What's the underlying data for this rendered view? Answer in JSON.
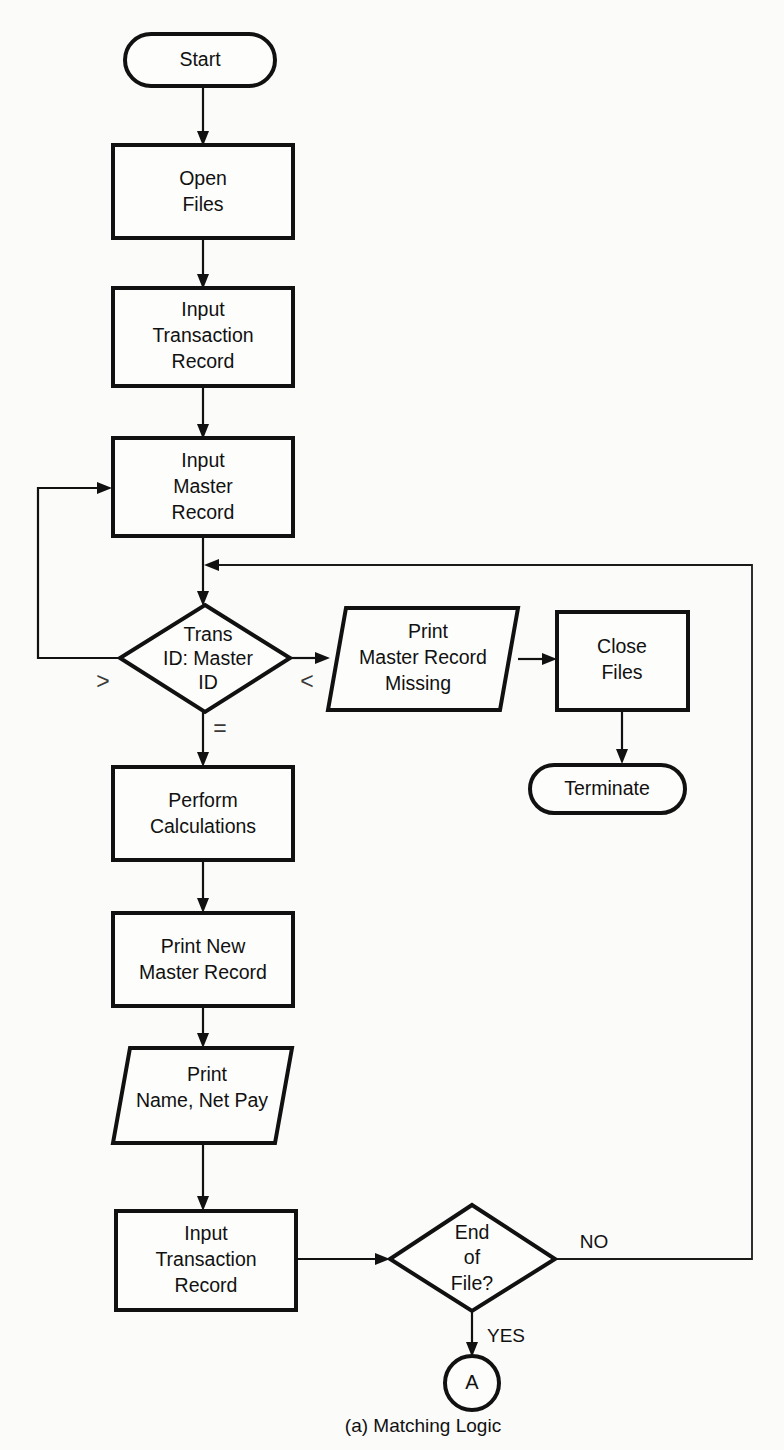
{
  "figure": {
    "caption": "(a)  Matching Logic",
    "caption_number": "(a)",
    "caption_title": "Matching Logic",
    "type": "flowchart",
    "background_color": "#fbfbf9",
    "line_color": "#111111",
    "fill_color": "#fdfdfb"
  },
  "nodes": {
    "start": {
      "shape": "terminator",
      "label": "Start",
      "x": 200,
      "y": 60,
      "w": 150,
      "h": 52
    },
    "open_files": {
      "shape": "process",
      "line1": "Open",
      "line2": "Files",
      "x": 203,
      "y": 191,
      "w": 180,
      "h": 93
    },
    "input_transaction_record_top": {
      "shape": "process",
      "line1": "Input",
      "line2": "Transaction",
      "line3": "Record",
      "x": 203,
      "y": 336,
      "w": 180,
      "h": 98
    },
    "input_master_record": {
      "shape": "process",
      "line1": "Input",
      "line2": "Master",
      "line3": "Record",
      "x": 203,
      "y": 487,
      "w": 180,
      "h": 98
    },
    "trans_id_master_id": {
      "shape": "decision",
      "line1": "Trans",
      "line2": "ID: Master",
      "line3": "ID",
      "x": 205,
      "y": 658,
      "w": 170,
      "h": 107
    },
    "print_master_record_missing": {
      "shape": "io-parallelogram",
      "line1": "Print",
      "line2": "Master Record",
      "line3": "Missing",
      "x": 423,
      "y": 659,
      "w": 190,
      "h": 102
    },
    "close_files": {
      "shape": "process",
      "line1": "Close",
      "line2": "Files",
      "x": 622,
      "y": 661,
      "w": 131,
      "h": 98
    },
    "terminate": {
      "shape": "terminator",
      "label": "Terminate",
      "x": 607,
      "y": 789,
      "w": 155,
      "h": 48
    },
    "perform_calculations": {
      "shape": "process",
      "line1": "Perform",
      "line2": "Calculations",
      "x": 203,
      "y": 813,
      "w": 180,
      "h": 93
    },
    "print_new_master_record": {
      "shape": "process",
      "line1": "Print New",
      "line2": "Master Record",
      "x": 203,
      "y": 959,
      "w": 180,
      "h": 93
    },
    "print_name_net_pay": {
      "shape": "io-parallelogram",
      "line1": "Print",
      "line2": "Name, Net Pay",
      "x": 203,
      "y": 1095,
      "w": 178,
      "h": 95
    },
    "input_transaction_record_bottom": {
      "shape": "process",
      "line1": "Input",
      "line2": "Transaction",
      "line3": "Record",
      "x": 206,
      "y": 1260,
      "w": 180,
      "h": 99
    },
    "end_of_file": {
      "shape": "decision",
      "line1": "End",
      "line2": "of",
      "line3": "File?",
      "x": 472,
      "y": 1257,
      "w": 166,
      "h": 104
    },
    "connector_a": {
      "shape": "connector-circle",
      "label": "A",
      "x": 472,
      "y": 1383,
      "r": 27
    }
  },
  "branch_labels": {
    "greater_than": ">",
    "less_than": "<",
    "equals": "=",
    "no": "NO",
    "yes": "YES"
  },
  "edges": [
    {
      "from": "start",
      "to": "open_files",
      "label": ""
    },
    {
      "from": "open_files",
      "to": "input_transaction_record_top",
      "label": ""
    },
    {
      "from": "input_transaction_record_top",
      "to": "input_master_record",
      "label": ""
    },
    {
      "from": "input_master_record",
      "to": "trans_id_master_id",
      "label": ""
    },
    {
      "from": "trans_id_master_id",
      "to": "input_master_record",
      "label": ">"
    },
    {
      "from": "trans_id_master_id",
      "to": "print_master_record_missing",
      "label": "<"
    },
    {
      "from": "trans_id_master_id",
      "to": "perform_calculations",
      "label": "="
    },
    {
      "from": "print_master_record_missing",
      "to": "close_files",
      "label": ""
    },
    {
      "from": "close_files",
      "to": "terminate",
      "label": ""
    },
    {
      "from": "perform_calculations",
      "to": "print_new_master_record",
      "label": ""
    },
    {
      "from": "print_new_master_record",
      "to": "print_name_net_pay",
      "label": ""
    },
    {
      "from": "print_name_net_pay",
      "to": "input_transaction_record_bottom",
      "label": ""
    },
    {
      "from": "input_transaction_record_bottom",
      "to": "end_of_file",
      "label": ""
    },
    {
      "from": "end_of_file",
      "to": "trans_id_master_id",
      "label": "NO"
    },
    {
      "from": "end_of_file",
      "to": "connector_a",
      "label": "YES"
    }
  ]
}
